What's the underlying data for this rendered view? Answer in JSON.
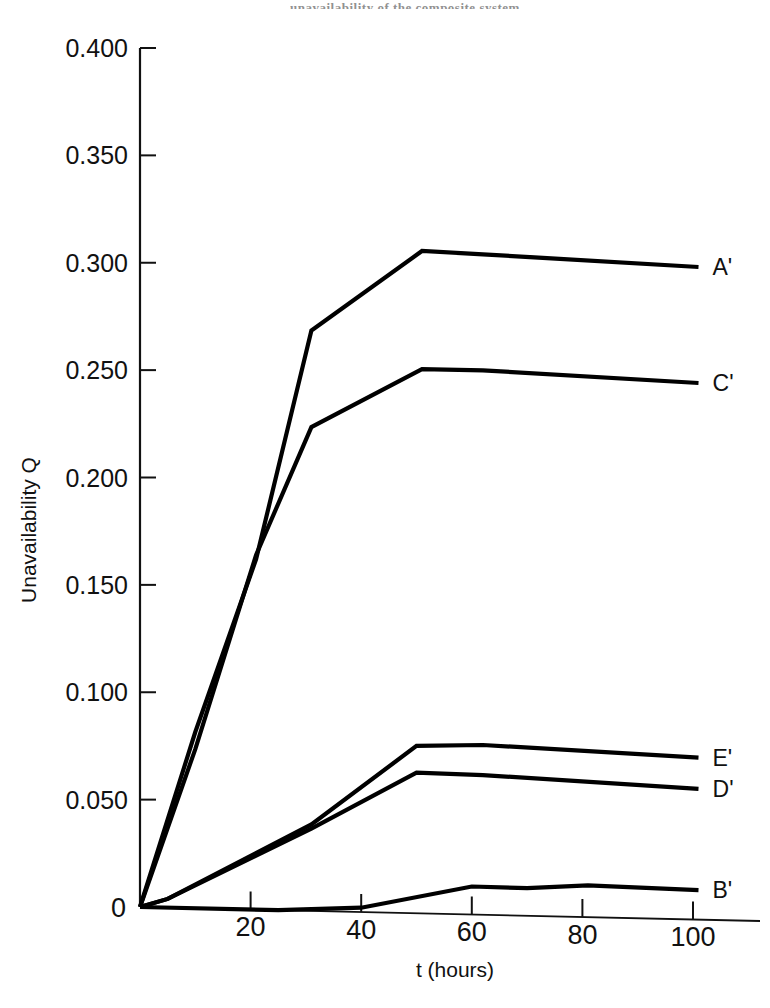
{
  "page": {
    "header_partial_text": "unavailability of the composite system",
    "background_color": "#ffffff",
    "ink_color": "#111111"
  },
  "chart_data": {
    "type": "line",
    "title": "",
    "subtitle": "",
    "xlabel": "t (hours)",
    "ylabel": "Unavailability Q",
    "xlim": [
      0,
      108
    ],
    "ylim": [
      0,
      0.4
    ],
    "grid": false,
    "legend_position": "right-of-line-ends",
    "xticks": [
      0,
      20,
      40,
      60,
      80,
      100
    ],
    "xtick_labels": [
      "0",
      "20",
      "40",
      "60",
      "80",
      "100"
    ],
    "yticks": [
      0,
      0.05,
      0.1,
      0.15,
      0.2,
      0.25,
      0.3,
      0.35,
      0.4
    ],
    "ytick_labels": [
      "0",
      "0.050",
      "0.100",
      "0.150",
      "0.200",
      "0.250",
      "0.300",
      "0.350",
      "0.400"
    ],
    "annotations": [],
    "series": [
      {
        "name": "A'",
        "label": "A'",
        "color": "#000000",
        "x": [
          0,
          10,
          21,
          31,
          51,
          62,
          101
        ],
        "y": [
          0,
          0.082,
          0.163,
          0.27,
          0.308,
          0.307,
          0.303
        ]
      },
      {
        "name": "C'",
        "label": "C'",
        "color": "#000000",
        "x": [
          0,
          10,
          21,
          31,
          51,
          62,
          101
        ],
        "y": [
          0,
          0.074,
          0.165,
          0.225,
          0.253,
          0.253,
          0.249
        ]
      },
      {
        "name": "E'",
        "label": "E'",
        "color": "#000000",
        "x": [
          0,
          5,
          31,
          50,
          62,
          101
        ],
        "y": [
          0,
          0.004,
          0.04,
          0.0775,
          0.0785,
          0.0745
        ]
      },
      {
        "name": "D'",
        "label": "D'",
        "color": "#000000",
        "x": [
          0,
          5,
          31,
          50,
          62,
          101
        ],
        "y": [
          0,
          0.004,
          0.038,
          0.065,
          0.0645,
          0.06
        ]
      },
      {
        "name": "B'",
        "label": "B'",
        "color": "#000000",
        "x": [
          0,
          25,
          40,
          60,
          70,
          81,
          101
        ],
        "y": [
          0,
          0.0,
          0.002,
          0.0125,
          0.0122,
          0.0141,
          0.0128
        ]
      }
    ]
  }
}
